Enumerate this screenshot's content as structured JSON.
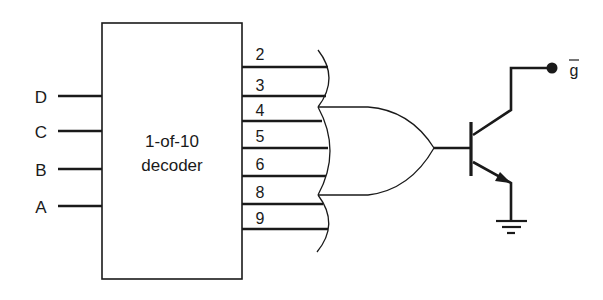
{
  "diagram": {
    "type": "circuit-schematic",
    "background": "#ffffff",
    "ink_color": "#1a1a1a",
    "decoder": {
      "title_line1": "1-of-10",
      "title_line2": "decoder",
      "inputs": [
        {
          "label": "D"
        },
        {
          "label": "C"
        },
        {
          "label": "B"
        },
        {
          "label": "A"
        }
      ],
      "outputs": [
        {
          "label": "2"
        },
        {
          "label": "3"
        },
        {
          "label": "4"
        },
        {
          "label": "5"
        },
        {
          "label": "6"
        },
        {
          "label": "8"
        },
        {
          "label": "9"
        }
      ]
    },
    "gate": {
      "type": "OR",
      "input_count": 7
    },
    "transistor": {
      "type": "NPN",
      "emitter": "ground"
    },
    "output": {
      "label": "g",
      "overbar": true,
      "display": "g̅"
    }
  }
}
